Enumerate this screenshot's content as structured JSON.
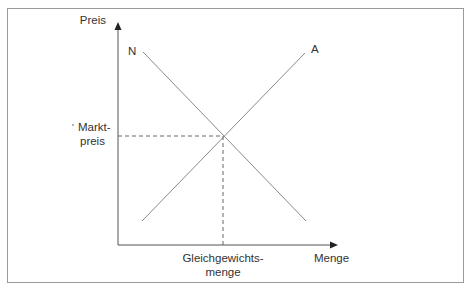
{
  "diagram": {
    "axes": {
      "y_label": "Preis",
      "x_label": "Menge"
    },
    "curves": {
      "demand_label": "N",
      "supply_label": "A"
    },
    "equilibrium": {
      "price_label_line1": "Markt-",
      "price_label_line2": "preis",
      "quantity_label_line1": "Gleichgewichts-",
      "quantity_label_line2": "menge"
    },
    "colors": {
      "frame": "#9a9a9a",
      "axis": "#555555",
      "curve": "#8a8a8a",
      "dashed": "#666666",
      "text": "#333333"
    }
  }
}
